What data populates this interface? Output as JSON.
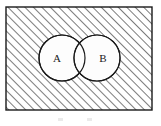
{
  "figure": {
    "universal_set": {
      "name": "universal-set-rectangle",
      "shading": "diagonal-hatch",
      "hatch_direction": "up-right",
      "hatch_color": "#4a4a4a",
      "hatch_spacing_px": 6,
      "border_color": "#1a1a1a",
      "fill_color": "#ffffff"
    },
    "sets": [
      {
        "label": "A",
        "name": "circle-a",
        "cx": 62,
        "cy": 58,
        "r": 23,
        "fill_color": "#fdfdfd",
        "stroke_color": "#1a1a1a",
        "shaded": false
      },
      {
        "label": "B",
        "name": "circle-b",
        "cx": 97,
        "cy": 58,
        "r": 23,
        "fill_color": "#fdfdfd",
        "stroke_color": "#1a1a1a",
        "shaded": false
      }
    ],
    "intersection": {
      "name": "intersection-lens",
      "label": "",
      "shaded": false,
      "fill_color": "#fdfdfd"
    },
    "shaded_region_description": "complement of A union B"
  }
}
